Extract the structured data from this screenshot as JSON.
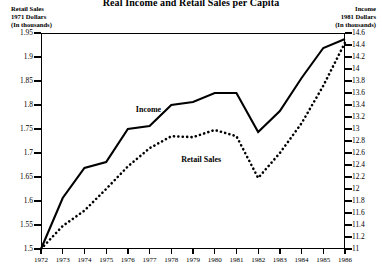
{
  "title": "Real Income and Retail Sales per Capita",
  "axis_headers": {
    "left": [
      "Retail Sales",
      "1971 Dollars",
      "(In thousands)"
    ],
    "right": [
      "Income",
      "1981 Dollars",
      "(In thousands)"
    ]
  },
  "series_labels": {
    "income": "Income",
    "retail": "Retail Sales"
  },
  "chart_data": {
    "type": "line",
    "title": "Real Income and Retail Sales per Capita",
    "xlabel": "",
    "ylabel": "Retail Sales 1971 Dollars (In thousands)",
    "y2label": "Income 1981 Dollars (In thousands)",
    "grid": false,
    "legend_position": "inline-annotation",
    "x": [
      1972,
      1973,
      1974,
      1975,
      1976,
      1977,
      1978,
      1979,
      1980,
      1981,
      1982,
      1983,
      1984,
      1985,
      1986
    ],
    "xticklabels": [
      "1972",
      "1973",
      "1974",
      "1975",
      "1976",
      "1977",
      "1978",
      "1979",
      "1980",
      "1981",
      "1982",
      "1983",
      "1984",
      "1985",
      "1986"
    ],
    "ylim": [
      1.5,
      1.95
    ],
    "yticks": [
      1.5,
      1.55,
      1.6,
      1.65,
      1.7,
      1.75,
      1.8,
      1.85,
      1.9,
      1.95
    ],
    "yticklabels": [
      "1.5",
      "1.55",
      "1.6",
      "1.65",
      "1.7",
      "1.75",
      "1.8",
      "1.85",
      "1.9",
      "1.95"
    ],
    "y2lim": [
      11,
      14.6
    ],
    "y2ticks": [
      11,
      11.2,
      11.4,
      11.6,
      11.8,
      12,
      12.2,
      12.4,
      12.6,
      12.8,
      13,
      13.2,
      13.4,
      13.6,
      13.8,
      14,
      14.2,
      14.4,
      14.6
    ],
    "y2ticklabels": [
      "11",
      "11.2",
      "11.4",
      "11.6",
      "11.8",
      "12",
      "12.2",
      "12.4",
      "12.6",
      "12.8",
      "13",
      "13.2",
      "13.4",
      "13.6",
      "13.8",
      "14",
      "14.2",
      "14.4",
      "14.6"
    ],
    "series": [
      {
        "name": "Income",
        "axis": "right",
        "style": "solid",
        "values": [
          11.0,
          11.85,
          12.35,
          12.45,
          13.0,
          13.05,
          13.4,
          13.45,
          13.6,
          13.6,
          12.95,
          13.3,
          13.85,
          14.35,
          14.5
        ]
      },
      {
        "name": "Retail Sales",
        "axis": "left",
        "style": "dotted",
        "values": [
          1.5,
          1.548,
          1.58,
          1.625,
          1.672,
          1.71,
          1.735,
          1.733,
          1.748,
          1.735,
          1.648,
          1.7,
          1.762,
          1.84,
          1.93
        ]
      }
    ]
  }
}
